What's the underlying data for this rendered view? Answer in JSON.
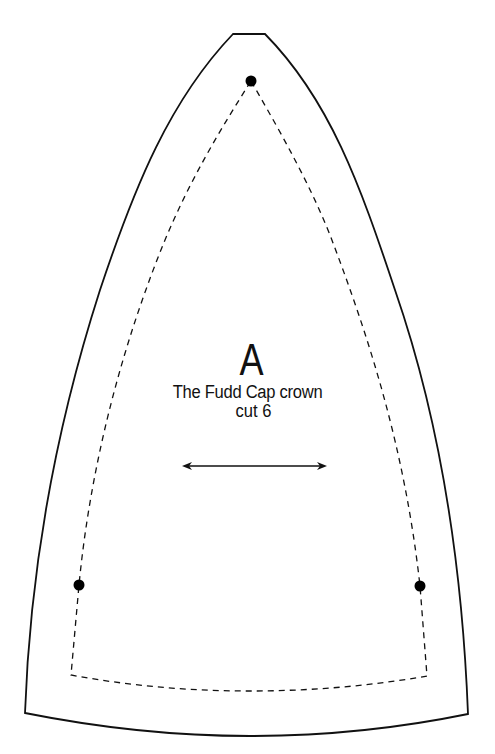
{
  "pattern_piece": {
    "letter": "A",
    "title": "The Fudd Cap crown",
    "cut_instruction": "cut 6"
  },
  "markings": {
    "cut_line": "solid outline",
    "seam_line": "dashed line",
    "notch_dots": 3,
    "grainline": "double-headed arrow"
  },
  "colors": {
    "line": "#111111",
    "background": "#ffffff"
  }
}
